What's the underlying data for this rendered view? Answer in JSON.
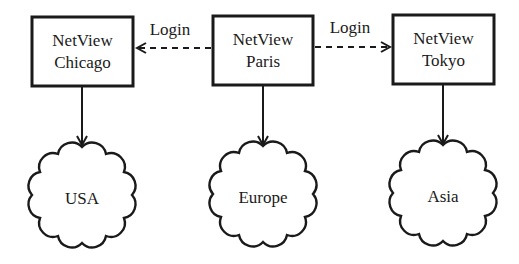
{
  "nodes": {
    "chicago": {
      "line1": "NetView",
      "line2": "Chicago"
    },
    "paris": {
      "line1": "NetView",
      "line2": "Paris"
    },
    "tokyo": {
      "line1": "NetView",
      "line2": "Tokyo"
    }
  },
  "clouds": {
    "usa": "USA",
    "europe": "Europe",
    "asia": "Asia"
  },
  "edges": {
    "paris_to_chicago": "Login",
    "paris_to_tokyo": "Login"
  },
  "colors": {
    "stroke": "#1a1a1a",
    "background": "#ffffff"
  }
}
